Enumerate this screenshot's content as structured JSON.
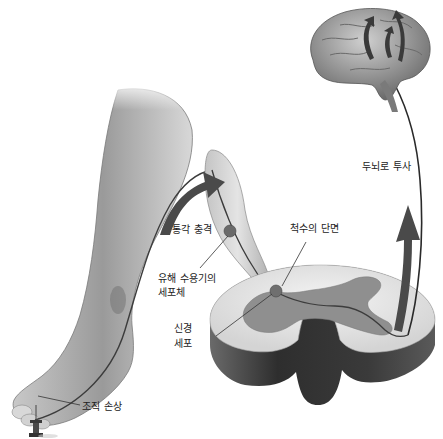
{
  "diagram": {
    "type": "pain-pathway-illustration",
    "labels": {
      "pain_impulse": "통각 충격",
      "spinal_cord_section": "척수의 단면",
      "nociceptor_cell_body_line1": "유해 수용기의",
      "nociceptor_cell_body_line2": "세포체",
      "nerve_cell_line1": "신경",
      "nerve_cell_line2": "세포",
      "tissue_damage": "조직 손상",
      "projection_to_brain": "두뇌로 투사"
    },
    "colors": {
      "skin_light": "#e6e6e6",
      "skin_dark": "#8a8a8a",
      "grey_matter": "#8f8f8f",
      "white_matter": "#e8e8e8",
      "cord_side": "#3a3a3a",
      "brain": "#9a9a9a",
      "arrow": "#4a4a4a",
      "leader_line": "#333333",
      "text": "#222222"
    }
  }
}
